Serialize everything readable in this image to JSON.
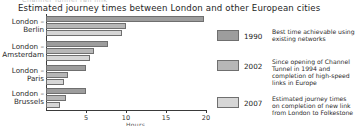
{
  "clipped_header": "Channel Tunnel rail link",
  "title": "Estimated journey times between London and other European cities",
  "chart_data": {
    "type": "bar",
    "orientation": "horizontal",
    "title": "Estimated journey times between London and other European cities",
    "xlabel": "Hours",
    "ylabel": "",
    "xlim": [
      0,
      20
    ],
    "xticks": [
      5,
      10,
      15,
      20
    ],
    "grid": false,
    "legend_position": "right",
    "categories": [
      "London – Berlin",
      "London – Amsterdam",
      "London – Paris",
      "London – Brussels"
    ],
    "category_lines": [
      [
        "London –",
        "Berlin"
      ],
      [
        "London –",
        "Amsterdam"
      ],
      [
        "London –",
        "Paris"
      ],
      [
        "London –",
        "Brussels"
      ]
    ],
    "series": [
      {
        "name": "1990",
        "color": "#9d9d9d",
        "values": [
          19.7,
          7.8,
          5.0,
          5.0
        ]
      },
      {
        "name": "2002",
        "color": "#b7b7b7",
        "values": [
          10.0,
          6.0,
          2.8,
          2.5
        ]
      },
      {
        "name": "2007",
        "color": "#d6d6d6",
        "values": [
          9.5,
          5.5,
          2.3,
          1.8
        ]
      }
    ]
  },
  "legend": {
    "entries": [
      {
        "year": "1990",
        "color": "#9d9d9d",
        "note_lines": [
          "Best time achievable using",
          "existing networks"
        ]
      },
      {
        "year": "2002",
        "color": "#b7b7b7",
        "note_lines": [
          "Since opening of Channel",
          "Tunnel in 1994 and",
          "completion of high-speed",
          "links in Europe"
        ]
      },
      {
        "year": "2007",
        "color": "#d6d6d6",
        "note_lines": [
          "Estimated journey times",
          "on completion of new link",
          "from London to Folkestone"
        ]
      }
    ]
  }
}
